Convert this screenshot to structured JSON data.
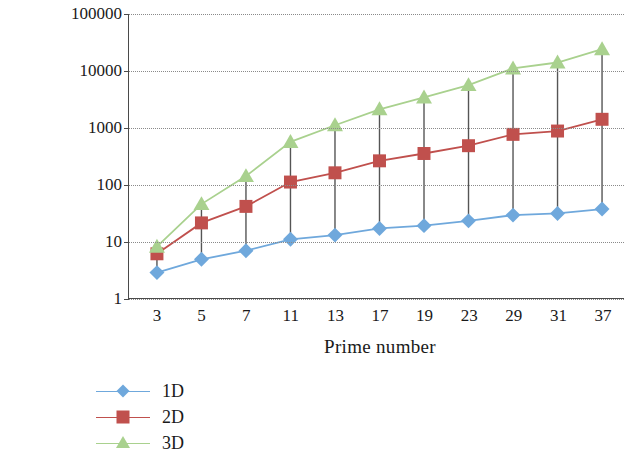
{
  "chart_data": {
    "type": "line",
    "title": "",
    "xlabel": "Prime number",
    "ylabel": "Number of users",
    "x_categories": [
      "3",
      "5",
      "7",
      "11",
      "13",
      "17",
      "19",
      "23",
      "29",
      "31",
      "37"
    ],
    "y_scale": "log",
    "ylim": [
      1,
      100000
    ],
    "y_ticks": [
      "1",
      "10",
      "100",
      "1000",
      "10000",
      "100000"
    ],
    "grid": true,
    "legend_position": "bottom-left",
    "series": [
      {
        "name": "1D",
        "color": "#6fa8dc",
        "marker": "diamond",
        "values": [
          2.8,
          4.8,
          6.8,
          10.8,
          12.8,
          16.8,
          18.8,
          22.8,
          28.8,
          30.8,
          36.8
        ]
      },
      {
        "name": "2D",
        "color": "#c0504d",
        "marker": "square",
        "values": [
          6,
          21,
          41,
          110,
          160,
          260,
          350,
          480,
          760,
          870,
          1400
        ]
      },
      {
        "name": "3D",
        "color": "#a9d18e",
        "marker": "triangle",
        "values": [
          8,
          45,
          140,
          560,
          1100,
          2100,
          3400,
          5600,
          11000,
          14000,
          24000
        ]
      }
    ]
  },
  "legend": {
    "items": [
      {
        "label": "1D"
      },
      {
        "label": "2D"
      },
      {
        "label": "3D"
      }
    ]
  }
}
